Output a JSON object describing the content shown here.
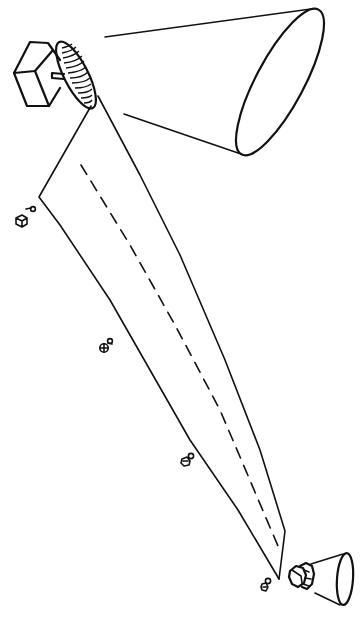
{
  "figure": {
    "description": "Line-art illustration: a radar/antenna transmitter box with hatched dish emitting a widening beam cone toward the upper right; a long tapered beam strip with dashed centerline runs diagonally to a small receiver cone at the lower right; small debris/satellite glyphs are scattered along the left edge of the beam.",
    "colors": {
      "ink": "#111111",
      "background": "#ffffff"
    }
  },
  "elements": {
    "transmitter_box": {
      "label": ""
    },
    "dish": {
      "label": ""
    },
    "large_cone": {
      "label": ""
    },
    "beam_strip": {
      "label": ""
    },
    "centerline": {
      "label": ""
    },
    "receiver_cone": {
      "label": ""
    },
    "receiver_nut": {
      "label": ""
    },
    "objects": [
      {
        "name": "object-1",
        "label": ""
      },
      {
        "name": "object-2",
        "label": ""
      },
      {
        "name": "object-3",
        "label": ""
      },
      {
        "name": "object-4",
        "label": ""
      }
    ]
  }
}
